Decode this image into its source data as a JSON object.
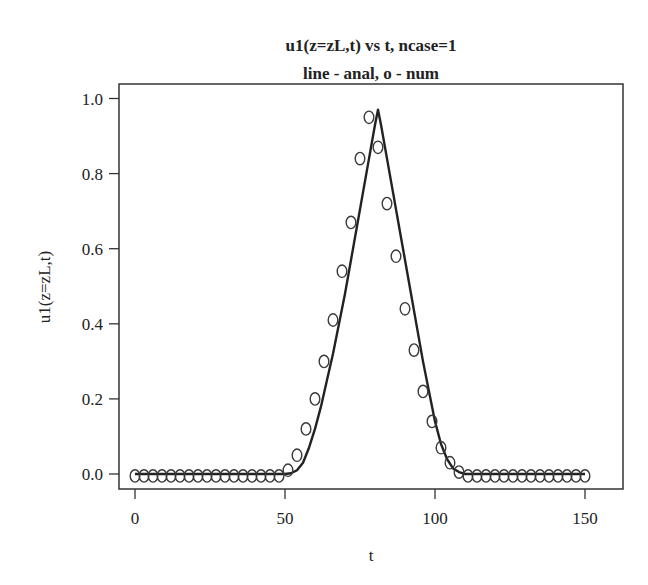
{
  "chart_data": {
    "type": "line",
    "title": "u1(z=zL,t) vs t, ncase=1",
    "subtitle": "line - anal, o - num",
    "xlabel": "t",
    "ylabel": "u1(z=zL,t)",
    "xlim": [
      -5,
      158
    ],
    "ylim": [
      -0.04,
      1.04
    ],
    "xticks": [
      0,
      50,
      100,
      150
    ],
    "xtick_labels": [
      "0",
      "50",
      "100",
      "150"
    ],
    "yticks": [
      0.0,
      0.2,
      0.4,
      0.6,
      0.8,
      1.0
    ],
    "ytick_labels": [
      "0.0",
      "0.2",
      "0.4",
      "0.6",
      "0.8",
      "1.0"
    ],
    "grid": false,
    "legend": "none (described in subtitle)",
    "series": [
      {
        "name": "anal",
        "style": "line",
        "color": "#222222",
        "x": [
          0,
          50,
          52,
          54,
          56,
          58,
          60,
          62,
          64,
          66,
          68,
          70,
          72,
          74,
          76,
          78,
          80,
          81,
          82,
          84,
          86,
          88,
          90,
          92,
          94,
          96,
          98,
          100,
          102,
          104,
          106,
          108,
          110,
          112,
          150
        ],
        "y": [
          0.0,
          0.0,
          0.002,
          0.01,
          0.03,
          0.07,
          0.12,
          0.18,
          0.25,
          0.32,
          0.4,
          0.48,
          0.57,
          0.66,
          0.75,
          0.84,
          0.93,
          0.97,
          0.93,
          0.84,
          0.75,
          0.66,
          0.57,
          0.48,
          0.39,
          0.3,
          0.22,
          0.14,
          0.08,
          0.04,
          0.015,
          0.005,
          0.0,
          0.0,
          0.0
        ]
      },
      {
        "name": "num",
        "style": "circle markers",
        "color": "#333333",
        "x": [
          0,
          3,
          6,
          9,
          12,
          15,
          18,
          21,
          24,
          27,
          30,
          33,
          36,
          39,
          42,
          45,
          48,
          51,
          54,
          57,
          60,
          63,
          66,
          69,
          72,
          75,
          78,
          81,
          84,
          87,
          90,
          93,
          96,
          99,
          102,
          105,
          108,
          111,
          114,
          117,
          120,
          123,
          126,
          129,
          132,
          135,
          138,
          141,
          144,
          147,
          150
        ],
        "y": [
          -0.005,
          -0.005,
          -0.005,
          -0.005,
          -0.005,
          -0.005,
          -0.005,
          -0.005,
          -0.005,
          -0.005,
          -0.005,
          -0.005,
          -0.005,
          -0.005,
          -0.005,
          -0.005,
          -0.005,
          0.01,
          0.05,
          0.12,
          0.2,
          0.3,
          0.41,
          0.54,
          0.67,
          0.84,
          0.95,
          0.87,
          0.72,
          0.58,
          0.44,
          0.33,
          0.22,
          0.14,
          0.07,
          0.03,
          0.005,
          -0.005,
          -0.005,
          -0.005,
          -0.005,
          -0.005,
          -0.005,
          -0.005,
          -0.005,
          -0.005,
          -0.005,
          -0.005,
          -0.005,
          -0.005,
          -0.005
        ]
      }
    ]
  },
  "layout": {
    "plot_box": {
      "left": 119,
      "top": 84,
      "right": 623,
      "bottom": 489
    },
    "x_map": {
      "x0_value": 0,
      "x0_px": 135,
      "px_per_unit": 3.0
    },
    "y_map": {
      "y0_value": 0,
      "y0_px": 474,
      "px_per_unit": 375.5
    },
    "colors": {
      "axis": "#333333",
      "line": "#222222",
      "marker": "#3a3a3a",
      "background": "#ffffff"
    }
  }
}
